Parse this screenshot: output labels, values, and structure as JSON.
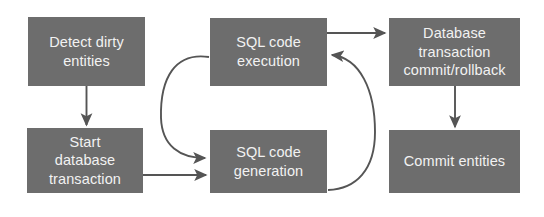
{
  "diagram": {
    "type": "flowchart",
    "canvas": {
      "width": 544,
      "height": 217,
      "background": "#ffffff"
    },
    "style": {
      "node_fill": "#6d6d6d",
      "node_text_color": "#f2f2f2",
      "arrow_color": "#555555"
    },
    "nodes": [
      {
        "id": "detect-dirty-entities",
        "label": "Detect dirty\nentities",
        "x": 28,
        "y": 17,
        "w": 117,
        "h": 69
      },
      {
        "id": "start-database-transaction",
        "label": "Start\ndatabase\ntransaction",
        "x": 27,
        "y": 128,
        "w": 116,
        "h": 65
      },
      {
        "id": "sql-code-execution",
        "label": "SQL code\nexecution",
        "x": 210,
        "y": 18,
        "w": 117,
        "h": 68
      },
      {
        "id": "sql-code-generation",
        "label": "SQL code\ngeneration",
        "x": 210,
        "y": 130,
        "w": 117,
        "h": 63
      },
      {
        "id": "database-transaction-commit-rollback",
        "label": "Database\ntransaction\ncommit/rollback",
        "x": 389,
        "y": 18,
        "w": 131,
        "h": 68
      },
      {
        "id": "commit-entities",
        "label": "Commit entities",
        "x": 389,
        "y": 130,
        "w": 131,
        "h": 63
      }
    ],
    "edges": [
      {
        "id": "detect-to-start",
        "from": "detect-dirty-entities",
        "to": "start-database-transaction",
        "shape": "straight-vertical"
      },
      {
        "id": "start-to-sql-generation",
        "from": "start-database-transaction",
        "to": "sql-code-generation",
        "shape": "straight-horizontal"
      },
      {
        "id": "sql-generation-to-sql-execution",
        "from": "sql-code-generation",
        "to": "sql-code-execution",
        "shape": "curve-right"
      },
      {
        "id": "sql-execution-to-sql-generation",
        "from": "sql-code-execution",
        "to": "sql-code-generation",
        "shape": "curve-left"
      },
      {
        "id": "sql-execution-to-database-transaction",
        "from": "sql-code-execution",
        "to": "database-transaction-commit-rollback",
        "shape": "straight-horizontal"
      },
      {
        "id": "database-transaction-to-commit-entities",
        "from": "database-transaction-commit-rollback",
        "to": "commit-entities",
        "shape": "straight-vertical"
      }
    ]
  }
}
